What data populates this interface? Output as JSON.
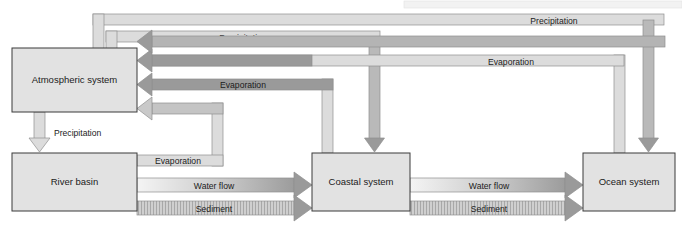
{
  "diagram": {
    "type": "block-flow-diagram",
    "canvas": {
      "width": 682,
      "height": 228
    },
    "colors": {
      "box_fill": "#e2e2e2",
      "box_stroke": "#3b3b3b",
      "arrow_dark_fill": "#9a9a9a",
      "arrow_light_fill": "#e0e0e0",
      "arrow_stroke": "#7d7d7d",
      "band_fill": "#dcdcdc",
      "page_background": "#ffffff",
      "text": "#1b1b1b"
    },
    "nodes": [
      {
        "id": "atmospheric",
        "label": "Atmospheric system",
        "x": 12,
        "y": 48,
        "w": 125,
        "h": 64
      },
      {
        "id": "river",
        "label": "River basin",
        "x": 12,
        "y": 153,
        "w": 125,
        "h": 58
      },
      {
        "id": "coastal",
        "label": "Coastal system",
        "x": 312,
        "y": 153,
        "w": 98,
        "h": 58
      },
      {
        "id": "ocean",
        "label": "Ocean system",
        "x": 583,
        "y": 153,
        "w": 92,
        "h": 58
      }
    ],
    "flows": [
      {
        "id": "precip-coastal-to-atmos",
        "label": "Precipitation",
        "from": "atmospheric",
        "to": "coastal",
        "label_x": 243,
        "label_y": 41,
        "kind": "precipitation",
        "tone": "dark"
      },
      {
        "id": "evap-coastal-to-atmos",
        "label": "Evaporation",
        "from": "coastal",
        "to": "atmospheric",
        "label_x": 243,
        "label_y": 88,
        "kind": "evaporation",
        "tone": "dark"
      },
      {
        "id": "precip-ocean-to-atmos",
        "label": "Precipitation",
        "from": "atmospheric",
        "to": "ocean",
        "label_x": 554,
        "label_y": 21,
        "kind": "precipitation",
        "tone": "dark"
      },
      {
        "id": "evap-ocean-to-atmos",
        "label": "Evaporation",
        "from": "ocean",
        "to": "atmospheric",
        "label_x": 511,
        "label_y": 62,
        "kind": "evaporation",
        "tone": "dark"
      },
      {
        "id": "precip-atmos-to-river",
        "label": "Precipitation",
        "from": "atmospheric",
        "to": "river",
        "label_x": 62,
        "label_y": 138,
        "kind": "precipitation",
        "tone": "light"
      },
      {
        "id": "evap-river-to-atmos",
        "label": "Evaporation",
        "from": "river",
        "to": "atmospheric",
        "label_x": 149,
        "label_y": 161,
        "kind": "evaporation",
        "tone": "light"
      },
      {
        "id": "water-river-to-coastal",
        "label": "Water flow",
        "from": "river",
        "to": "coastal",
        "label_x": 214,
        "label_y": 187,
        "kind": "water-flow",
        "tone": "gradient"
      },
      {
        "id": "sediment-river-to-coastal",
        "label": "Sediment",
        "from": "river",
        "to": "coastal",
        "label_x": 214,
        "label_y": 210,
        "kind": "sediment",
        "tone": "hatched"
      },
      {
        "id": "water-coastal-to-ocean",
        "label": "Water flow",
        "from": "coastal",
        "to": "ocean",
        "label_x": 496,
        "label_y": 187,
        "kind": "water-flow",
        "tone": "gradient"
      },
      {
        "id": "sediment-coastal-to-ocean",
        "label": "Sediment",
        "from": "coastal",
        "to": "ocean",
        "label_x": 496,
        "label_y": 210,
        "kind": "sediment",
        "tone": "hatched"
      }
    ]
  }
}
